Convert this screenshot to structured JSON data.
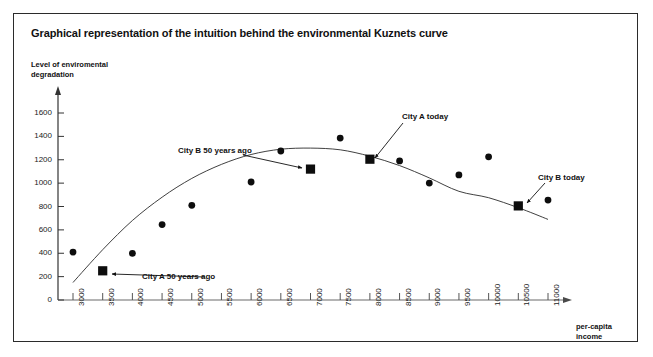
{
  "figure": {
    "title": "Graphical representation of the intuition behind the environmental Kuznets curve",
    "border_color": "#2b2b2b",
    "background": "#ffffff",
    "ink_color": "#111111"
  },
  "axes": {
    "y_label_line1": "Level of enviromental",
    "y_label_line2": "degradation",
    "x_label_line1": "per-capita",
    "x_label_line2": "income",
    "y_ticks": [
      0,
      200,
      400,
      600,
      800,
      1000,
      1200,
      1400,
      1600
    ],
    "x_ticks": [
      3000,
      3500,
      4000,
      4500,
      5000,
      5500,
      6000,
      6500,
      7000,
      7500,
      8000,
      8500,
      9000,
      9500,
      10000,
      10500,
      11000
    ]
  },
  "annotations": [
    {
      "id": "city-a-50-years-ago",
      "label": "City A 50 years ago"
    },
    {
      "id": "city-b-50-years-ago",
      "label": "City B 50 years ago"
    },
    {
      "id": "city-a-today",
      "label": "City A today"
    },
    {
      "id": "city-b-today",
      "label": "City B today"
    }
  ],
  "chart_data": {
    "type": "scatter",
    "title": "Graphical representation of the intuition behind the environmental Kuznets curve",
    "xlabel": "per-capita income",
    "ylabel": "Level of enviromental degradation",
    "xlim": [
      2750,
      11350
    ],
    "ylim": [
      0,
      1700
    ],
    "grid": false,
    "legend": "none",
    "x_tick_labels": [
      "3000",
      "3500",
      "4000",
      "4500",
      "5000",
      "5500",
      "6000",
      "6500",
      "7000",
      "7500",
      "8000",
      "8500",
      "9000",
      "9500",
      "10000",
      "10500",
      "11000"
    ],
    "y_tick_labels": [
      "0",
      "200",
      "400",
      "600",
      "800",
      "1000",
      "1200",
      "1400",
      "1600"
    ],
    "series": [
      {
        "name": "observed cities",
        "marker": "circle",
        "points": [
          {
            "x": 3000,
            "y": 410
          },
          {
            "x": 4000,
            "y": 400
          },
          {
            "x": 4500,
            "y": 645
          },
          {
            "x": 5000,
            "y": 810
          },
          {
            "x": 6000,
            "y": 1010
          },
          {
            "x": 6500,
            "y": 1275
          },
          {
            "x": 7500,
            "y": 1385
          },
          {
            "x": 8500,
            "y": 1190
          },
          {
            "x": 9000,
            "y": 1000
          },
          {
            "x": 9500,
            "y": 1070
          },
          {
            "x": 10000,
            "y": 1225
          },
          {
            "x": 11000,
            "y": 855
          }
        ]
      },
      {
        "name": "highlighted cities",
        "marker": "square",
        "points": [
          {
            "x": 3500,
            "y": 250,
            "label": "City A 50 years ago"
          },
          {
            "x": 7000,
            "y": 1120,
            "label": "City B 50 years ago"
          },
          {
            "x": 8000,
            "y": 1205,
            "label": "City A today"
          },
          {
            "x": 10500,
            "y": 805,
            "label": "City B today"
          }
        ]
      }
    ],
    "fit_curve": {
      "name": "environmental Kuznets curve",
      "shape": "inverted-U quadratic",
      "points": [
        {
          "x": 3000,
          "y": 150
        },
        {
          "x": 3500,
          "y": 430
        },
        {
          "x": 4000,
          "y": 680
        },
        {
          "x": 4500,
          "y": 880
        },
        {
          "x": 5000,
          "y": 1040
        },
        {
          "x": 5500,
          "y": 1160
        },
        {
          "x": 6000,
          "y": 1245
        },
        {
          "x": 6500,
          "y": 1290
        },
        {
          "x": 7000,
          "y": 1300
        },
        {
          "x": 7500,
          "y": 1285
        },
        {
          "x": 8000,
          "y": 1230
        },
        {
          "x": 8500,
          "y": 1150
        },
        {
          "x": 9000,
          "y": 1045
        },
        {
          "x": 9500,
          "y": 930
        },
        {
          "x": 10000,
          "y": 875
        },
        {
          "x": 10500,
          "y": 790
        },
        {
          "x": 11000,
          "y": 690
        }
      ]
    }
  }
}
